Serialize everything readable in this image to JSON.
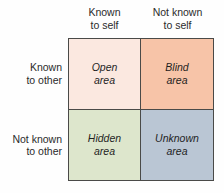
{
  "diagram": {
    "type": "2x2-matrix",
    "background_color": "#fefefe",
    "border_color": "#4a4a48",
    "text_color": "#2b2b2b"
  },
  "columns": [
    {
      "line1": "Known",
      "line2": "to self"
    },
    {
      "line1": "Not known",
      "line2": "to self"
    }
  ],
  "rows": [
    {
      "line1": "Known",
      "line2": "to other"
    },
    {
      "line1": "Not known",
      "line2": "to other"
    }
  ],
  "cells": [
    {
      "key": "open",
      "line1": "Open",
      "line2": "area",
      "color": "#fbe8e0",
      "row": "Known to other",
      "column": "Known to self"
    },
    {
      "key": "blind",
      "line1": "Blind",
      "line2": "area",
      "color": "#f7c4a8",
      "row": "Known to other",
      "column": "Not known to self"
    },
    {
      "key": "hidden",
      "line1": "Hidden",
      "line2": "area",
      "color": "#dde6cc",
      "row": "Not known to other",
      "column": "Known to self"
    },
    {
      "key": "unknown",
      "line1": "Unknown",
      "line2": "area",
      "color": "#bac6d4",
      "row": "Not known to other",
      "column": "Not known to self"
    }
  ]
}
